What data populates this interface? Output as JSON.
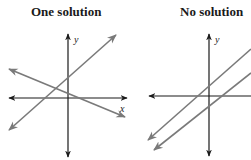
{
  "panels": [
    {
      "title": "One solution",
      "x_axis_label": "x",
      "y_axis_label": "y",
      "description": "Two intersecting lines"
    },
    {
      "title": "No solution",
      "x_axis_label": "x",
      "y_axis_label": "y",
      "description": "Two parallel lines"
    }
  ],
  "colors": {
    "axis": "#1a1a1a",
    "line": "#7a7a7a",
    "title": "#1a1a1a"
  }
}
